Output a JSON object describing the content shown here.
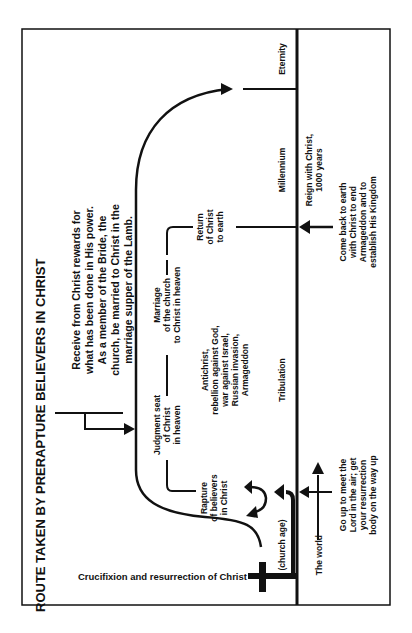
{
  "diagram": {
    "title": "ROUTE TAKEN BY PRERAPTURE BELIEVERS IN CHRIST",
    "orientation": "rotated 90° counter-clockwise",
    "colors": {
      "ink": "#111111",
      "paper": "#ffffff"
    },
    "rewards_note": {
      "lines": [
        "Receive from Christ rewards for",
        "what has been done in His power.",
        "As a member of the Bride, the",
        "church, be married to Christ in the",
        "marriage supper of the Lamb."
      ]
    },
    "events": {
      "judgment_seat": [
        "Judgment seat",
        "of Christ",
        "in heaven"
      ],
      "marriage": [
        "Marriage",
        "of the church",
        "to Christ in heaven"
      ],
      "return": [
        "Return",
        "of Christ",
        "to earth"
      ],
      "rapture": [
        "Rapture",
        "of believers",
        "in Christ"
      ],
      "tribulation_events": [
        "Antichrist,",
        "rebellion against God,",
        "war against Israel,",
        "Russian invasion,",
        "Armageddon"
      ]
    },
    "periods": {
      "eternity": "Eternity",
      "millennium": "Millennium",
      "tribulation": "Tribulation",
      "church_age": "(church age)"
    },
    "world_side": {
      "the_world": "The world",
      "reign": [
        "Reign with Christ,",
        "1000 years"
      ],
      "come_back": [
        "Come back to earth",
        "with Christ to end",
        "Armageddon and to",
        "establish His Kingdom"
      ],
      "go_up": [
        "Go up to meet the",
        "Lord in the air; get",
        "your resurrection",
        "body on the way up"
      ]
    },
    "crucifixion_label": "Crucifixion and resurrection of Christ"
  }
}
